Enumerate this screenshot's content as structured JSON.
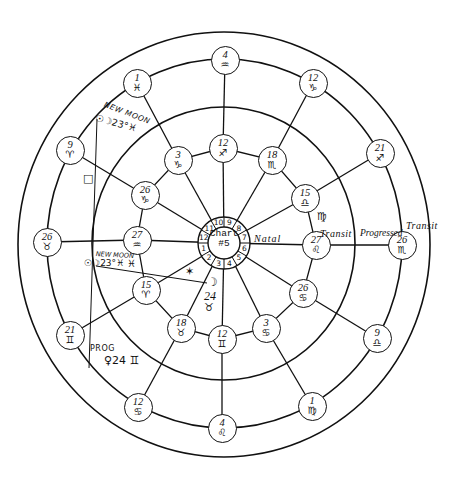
{
  "chart_center": {
    "line1": "Chart",
    "line2": "#5"
  },
  "houses": [
    "1",
    "2",
    "3",
    "4",
    "5",
    "6",
    "7",
    "8",
    "9",
    "10",
    "11",
    "12"
  ],
  "ring_labels": {
    "natal": "Natal",
    "transit_inner": "Transit",
    "progressed": "Progressed",
    "transit_outer": "Transit"
  },
  "natal_cusps": [
    {
      "deg": "27",
      "sign": "♒"
    },
    {
      "deg": "15",
      "sign": "♈"
    },
    {
      "deg": "18",
      "sign": "♉"
    },
    {
      "deg": "12",
      "sign": "♊"
    },
    {
      "deg": "3",
      "sign": "♋"
    },
    {
      "deg": "26",
      "sign": "♋"
    },
    {
      "deg": "27",
      "sign": "♌"
    },
    {
      "deg": "15",
      "sign": "♎"
    },
    {
      "deg": "18",
      "sign": "♏"
    },
    {
      "deg": "12",
      "sign": "♐"
    },
    {
      "deg": "3",
      "sign": "♑"
    },
    {
      "deg": "26",
      "sign": "♑"
    }
  ],
  "outer_cusps": [
    {
      "deg": "26",
      "sign": "♉"
    },
    {
      "deg": "21",
      "sign": "♊"
    },
    {
      "deg": "12",
      "sign": "♋"
    },
    {
      "deg": "4",
      "sign": "♌"
    },
    {
      "deg": "1",
      "sign": "♍"
    },
    {
      "deg": "9",
      "sign": "♎"
    },
    {
      "deg": "26",
      "sign": "♏"
    },
    {
      "deg": "21",
      "sign": "♐"
    },
    {
      "deg": "12",
      "sign": "♑"
    },
    {
      "deg": "4",
      "sign": "♒"
    },
    {
      "deg": "1",
      "sign": "♓"
    },
    {
      "deg": "9",
      "sign": "♈"
    }
  ],
  "intercepted": {
    "virgo": "♍",
    "pisces": "♓"
  },
  "annotations": {
    "new_moon_upper": {
      "title": "NEW MOON",
      "value": "☉☽23°♓"
    },
    "square_aspect": "□",
    "new_moon_lower": {
      "title": "NEW MOON",
      "value": "☉☽23°♓"
    },
    "sextile_aspect": "✶",
    "moon": {
      "symbol": "☽",
      "degree": "24",
      "sign": "♉"
    },
    "prog_venus": {
      "title": "PROG",
      "value": "♀24 ♊"
    }
  }
}
